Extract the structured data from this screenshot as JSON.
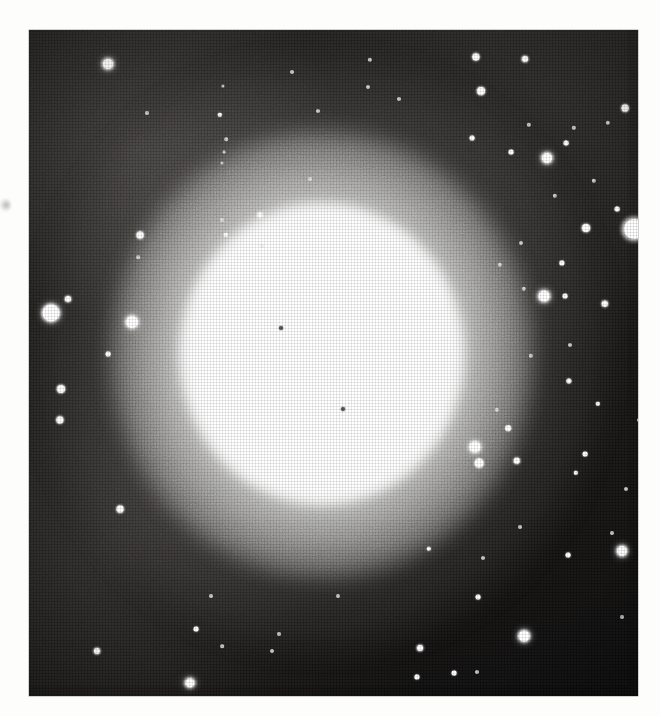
{
  "document": {
    "type": "halftone-printed astronomical photograph",
    "subject": "globular star cluster",
    "page_background": "#fdfdfb",
    "plate": {
      "background": "#100f0e",
      "left": 29,
      "top": 30,
      "width": 609,
      "height": 666,
      "description": "Dense spherical star cluster with saturated white core, smoothly fading halo, and a surrounding field of resolved point stars on a dark grainy sky."
    },
    "margin_marks": [
      {
        "name": "left-margin-smudge",
        "x": 3,
        "y": 205,
        "note": "faint gray print smudge on the paper margin"
      }
    ],
    "cluster": {
      "center_x": 322,
      "center_y": 354,
      "core_radius_px": 95,
      "halo_radius_px": 285,
      "core_color": "#ffffff",
      "halo_falloff": "smooth radial, slightly elongated vertically"
    },
    "core_specks": [
      {
        "x": 281,
        "y": 328,
        "size": 4
      },
      {
        "x": 343,
        "y": 409,
        "size": 4
      }
    ],
    "edge_star": {
      "x": 634,
      "y": 229,
      "size": 20,
      "note": "bright star bleeding past the right plate border"
    },
    "stars": [
      {
        "x": 108,
        "y": 64,
        "r": 5.0,
        "c": "s-big"
      },
      {
        "x": 220,
        "y": 115,
        "r": 2.2,
        "c": "s-sm"
      },
      {
        "x": 292,
        "y": 72,
        "r": 2.0,
        "c": "s-faint"
      },
      {
        "x": 223,
        "y": 86,
        "r": 1.6,
        "c": "s-faint"
      },
      {
        "x": 147,
        "y": 113,
        "r": 2.0,
        "c": "s-faint"
      },
      {
        "x": 226,
        "y": 139,
        "r": 1.8,
        "c": "s-faint"
      },
      {
        "x": 222,
        "y": 163,
        "r": 1.5,
        "c": "s-faint"
      },
      {
        "x": 224,
        "y": 152,
        "r": 1.4,
        "c": "s-faint"
      },
      {
        "x": 140,
        "y": 235,
        "r": 3.4,
        "c": "s-mid"
      },
      {
        "x": 138,
        "y": 257,
        "r": 1.8,
        "c": "s-faint"
      },
      {
        "x": 222,
        "y": 220,
        "r": 2.0,
        "c": "s-faint"
      },
      {
        "x": 260,
        "y": 215,
        "r": 2.6,
        "c": "s-mid"
      },
      {
        "x": 226,
        "y": 235,
        "r": 2.2,
        "c": "s-sm"
      },
      {
        "x": 51,
        "y": 313,
        "r": 8.5,
        "c": "s-big"
      },
      {
        "x": 68,
        "y": 299,
        "r": 3.0,
        "c": "s-mid"
      },
      {
        "x": 132,
        "y": 322,
        "r": 6.0,
        "c": "s-big"
      },
      {
        "x": 108,
        "y": 354,
        "r": 2.4,
        "c": "s-sm"
      },
      {
        "x": 61,
        "y": 389,
        "r": 4.0,
        "c": "s-mid"
      },
      {
        "x": 60,
        "y": 420,
        "r": 3.6,
        "c": "s-mid"
      },
      {
        "x": 120,
        "y": 509,
        "r": 3.4,
        "c": "s-mid"
      },
      {
        "x": 97,
        "y": 651,
        "r": 3.0,
        "c": "s-mid"
      },
      {
        "x": 190,
        "y": 683,
        "r": 4.6,
        "c": "s-big"
      },
      {
        "x": 211,
        "y": 596,
        "r": 2.0,
        "c": "s-faint"
      },
      {
        "x": 196,
        "y": 629,
        "r": 2.4,
        "c": "s-sm"
      },
      {
        "x": 222,
        "y": 646,
        "r": 1.8,
        "c": "s-faint"
      },
      {
        "x": 272,
        "y": 651,
        "r": 2.0,
        "c": "s-faint"
      },
      {
        "x": 420,
        "y": 648,
        "r": 3.0,
        "c": "s-mid"
      },
      {
        "x": 417,
        "y": 677,
        "r": 2.6,
        "c": "s-sm"
      },
      {
        "x": 454,
        "y": 673,
        "r": 2.4,
        "c": "s-sm"
      },
      {
        "x": 477,
        "y": 672,
        "r": 2.0,
        "c": "s-faint"
      },
      {
        "x": 478,
        "y": 597,
        "r": 2.4,
        "c": "s-sm"
      },
      {
        "x": 483,
        "y": 558,
        "r": 2.0,
        "c": "s-faint"
      },
      {
        "x": 524,
        "y": 636,
        "r": 5.4,
        "c": "s-big"
      },
      {
        "x": 520,
        "y": 527,
        "r": 2.0,
        "c": "s-faint"
      },
      {
        "x": 429,
        "y": 549,
        "r": 2.2,
        "c": "s-sm"
      },
      {
        "x": 568,
        "y": 555,
        "r": 2.4,
        "c": "s-sm"
      },
      {
        "x": 622,
        "y": 551,
        "r": 5.0,
        "c": "s-big"
      },
      {
        "x": 612,
        "y": 533,
        "r": 2.0,
        "c": "s-faint"
      },
      {
        "x": 626,
        "y": 489,
        "r": 2.0,
        "c": "s-faint"
      },
      {
        "x": 585,
        "y": 454,
        "r": 2.4,
        "c": "s-sm"
      },
      {
        "x": 576,
        "y": 473,
        "r": 2.2,
        "c": "s-sm"
      },
      {
        "x": 475,
        "y": 447,
        "r": 5.6,
        "c": "s-big"
      },
      {
        "x": 479,
        "y": 463,
        "r": 4.4,
        "c": "s-mid"
      },
      {
        "x": 517,
        "y": 461,
        "r": 3.2,
        "c": "s-mid"
      },
      {
        "x": 508,
        "y": 428,
        "r": 2.8,
        "c": "s-sm"
      },
      {
        "x": 440,
        "y": 435,
        "r": 2.0,
        "c": "s-faint"
      },
      {
        "x": 497,
        "y": 410,
        "r": 2.2,
        "c": "s-faint"
      },
      {
        "x": 598,
        "y": 404,
        "r": 2.2,
        "c": "s-sm"
      },
      {
        "x": 569,
        "y": 381,
        "r": 2.6,
        "c": "s-sm"
      },
      {
        "x": 570,
        "y": 345,
        "r": 2.0,
        "c": "s-faint"
      },
      {
        "x": 531,
        "y": 356,
        "r": 2.2,
        "c": "s-faint"
      },
      {
        "x": 605,
        "y": 304,
        "r": 3.2,
        "c": "s-mid"
      },
      {
        "x": 565,
        "y": 296,
        "r": 2.4,
        "c": "s-sm"
      },
      {
        "x": 562,
        "y": 263,
        "r": 2.6,
        "c": "s-sm"
      },
      {
        "x": 544,
        "y": 296,
        "r": 5.4,
        "c": "s-big"
      },
      {
        "x": 524,
        "y": 289,
        "r": 2.2,
        "c": "s-faint"
      },
      {
        "x": 500,
        "y": 265,
        "r": 2.2,
        "c": "s-faint"
      },
      {
        "x": 521,
        "y": 243,
        "r": 2.0,
        "c": "s-faint"
      },
      {
        "x": 586,
        "y": 228,
        "r": 4.0,
        "c": "s-mid"
      },
      {
        "x": 617,
        "y": 209,
        "r": 2.4,
        "c": "s-sm"
      },
      {
        "x": 594,
        "y": 181,
        "r": 2.2,
        "c": "s-faint"
      },
      {
        "x": 555,
        "y": 196,
        "r": 2.2,
        "c": "s-faint"
      },
      {
        "x": 547,
        "y": 158,
        "r": 5.0,
        "c": "s-big"
      },
      {
        "x": 566,
        "y": 143,
        "r": 2.4,
        "c": "s-sm"
      },
      {
        "x": 574,
        "y": 128,
        "r": 2.2,
        "c": "s-faint"
      },
      {
        "x": 511,
        "y": 152,
        "r": 2.4,
        "c": "s-sm"
      },
      {
        "x": 529,
        "y": 125,
        "r": 2.2,
        "c": "s-faint"
      },
      {
        "x": 472,
        "y": 138,
        "r": 2.4,
        "c": "s-sm"
      },
      {
        "x": 481,
        "y": 91,
        "r": 4.0,
        "c": "s-mid"
      },
      {
        "x": 525,
        "y": 59,
        "r": 3.0,
        "c": "s-mid"
      },
      {
        "x": 476,
        "y": 57,
        "r": 3.6,
        "c": "s-mid"
      },
      {
        "x": 625,
        "y": 108,
        "r": 3.4,
        "c": "s-mid"
      },
      {
        "x": 608,
        "y": 123,
        "r": 2.2,
        "c": "s-faint"
      },
      {
        "x": 370,
        "y": 60,
        "r": 2.2,
        "c": "s-faint"
      },
      {
        "x": 399,
        "y": 99,
        "r": 2.0,
        "c": "s-faint"
      },
      {
        "x": 368,
        "y": 87,
        "r": 2.0,
        "c": "s-faint"
      },
      {
        "x": 318,
        "y": 111,
        "r": 2.0,
        "c": "s-faint"
      },
      {
        "x": 262,
        "y": 246,
        "r": 2.0,
        "c": "s-faint"
      },
      {
        "x": 310,
        "y": 179,
        "r": 2.0,
        "c": "s-faint"
      },
      {
        "x": 279,
        "y": 634,
        "r": 2.0,
        "c": "s-faint"
      },
      {
        "x": 338,
        "y": 596,
        "r": 2.0,
        "c": "s-faint"
      },
      {
        "x": 622,
        "y": 617,
        "r": 2.0,
        "c": "s-faint"
      },
      {
        "x": 639,
        "y": 420,
        "r": 2.0,
        "c": "s-faint"
      }
    ]
  }
}
